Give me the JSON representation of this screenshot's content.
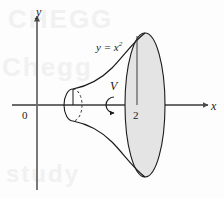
{
  "figure": {
    "axes": {
      "y_axis_label": "y",
      "x_axis_label": "x",
      "origin_label": "0"
    },
    "annotations": {
      "curve_label_base": "y = x",
      "curve_label_exponent": "2",
      "volume_label": "V",
      "tick_label": "2"
    },
    "watermark": {
      "line1": "CHEGG",
      "line2": "Chegg",
      "line3": "study"
    },
    "colors": {
      "stroke": "#1a1a1a",
      "axis": "#555555",
      "fill": "#e4e4e4",
      "background": "#fdfdfd",
      "watermark": "#f1f1f1"
    },
    "geometry": {
      "x_axis_y": 105,
      "y_axis_x": 37,
      "small_disk_center_x": 73,
      "small_disk_rx": 9,
      "small_disk_ry": 16,
      "big_disk_center_x": 145,
      "big_disk_rx": 20,
      "big_disk_ry": 72,
      "radius_line_x": 137
    }
  }
}
